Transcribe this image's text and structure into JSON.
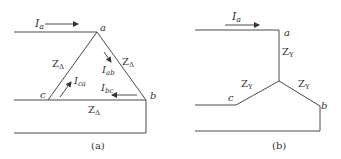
{
  "colors": {
    "line": "#4a4a4a",
    "text": "#333333"
  },
  "diagram_a": {
    "caption": "(a)",
    "current_line": {
      "symbol": "I",
      "sub": "a"
    },
    "nodes": {
      "a": "a",
      "b": "b",
      "c": "c"
    },
    "impedance": {
      "symbol": "Z",
      "sub": "Δ"
    },
    "phase_currents": [
      {
        "symbol": "I",
        "sub": "ab"
      },
      {
        "symbol": "I",
        "sub": "ca"
      },
      {
        "symbol": "I",
        "sub": "bc"
      }
    ]
  },
  "diagram_b": {
    "caption": "(b)",
    "current_line": {
      "symbol": "I",
      "sub": "a"
    },
    "nodes": {
      "a": "a",
      "b": "b",
      "c": "c"
    },
    "impedance": {
      "symbol": "Z",
      "sub": "Y"
    }
  }
}
